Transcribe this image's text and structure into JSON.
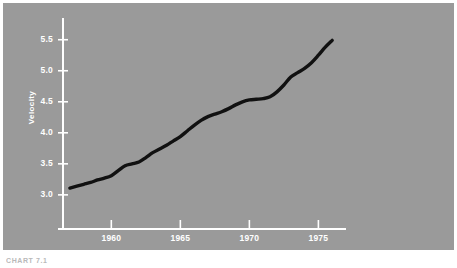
{
  "figure": {
    "caption": "CHART 7.1",
    "background_color": "#9a9a9a",
    "axis_color": "#ffffff",
    "line_color": "#111111",
    "page_color": "#ffffff"
  },
  "chart_data": {
    "type": "line",
    "title": "",
    "subtitle": "",
    "xlabel": "",
    "ylabel": "Velocity",
    "xlim": [
      1956.5,
      1977.0
    ],
    "ylim": [
      2.45,
      5.85
    ],
    "grid": false,
    "legend": null,
    "xticks": [
      1960,
      1965,
      1970,
      1975
    ],
    "xtick_labels": [
      "1960",
      "1965",
      "1970",
      "1975"
    ],
    "yticks": [
      3.0,
      3.5,
      4.0,
      4.5,
      5.0,
      5.5
    ],
    "ytick_labels": [
      "3.0",
      "3.5",
      "4.0",
      "4.5",
      "5.0",
      "5.5"
    ],
    "series": [
      {
        "name": "Velocity",
        "x": [
          1957.0,
          1957.5,
          1958.0,
          1958.5,
          1959.0,
          1959.5,
          1960.0,
          1960.5,
          1961.0,
          1961.5,
          1962.0,
          1962.5,
          1963.0,
          1963.5,
          1964.0,
          1964.5,
          1965.0,
          1965.5,
          1966.0,
          1966.5,
          1967.0,
          1967.5,
          1968.0,
          1968.5,
          1969.0,
          1969.5,
          1970.0,
          1970.5,
          1971.0,
          1971.5,
          1972.0,
          1972.5,
          1973.0,
          1973.5,
          1974.0,
          1974.5,
          1975.0,
          1975.5,
          1976.0
        ],
        "y": [
          3.11,
          3.14,
          3.17,
          3.2,
          3.24,
          3.27,
          3.31,
          3.39,
          3.47,
          3.5,
          3.53,
          3.6,
          3.68,
          3.74,
          3.8,
          3.87,
          3.94,
          4.03,
          4.12,
          4.2,
          4.26,
          4.3,
          4.34,
          4.39,
          4.45,
          4.5,
          4.53,
          4.54,
          4.55,
          4.58,
          4.66,
          4.77,
          4.9,
          4.97,
          5.04,
          5.13,
          5.25,
          5.38,
          5.49
        ]
      }
    ]
  }
}
